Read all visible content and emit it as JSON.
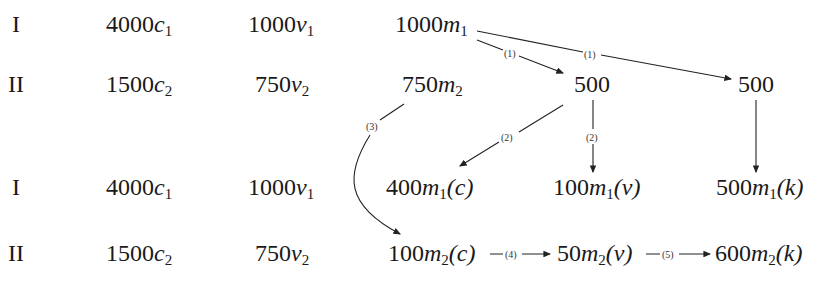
{
  "rows": [
    {
      "sector": "I",
      "c": "4000",
      "c_sym": "c",
      "c_sub": "1",
      "v": "1000",
      "v_sym": "v",
      "v_sub": "1",
      "m": "1000",
      "m_sym": "m",
      "m_sub": "1"
    },
    {
      "sector": "II",
      "c": "1500",
      "c_sym": "c",
      "c_sub": "2",
      "v": "750",
      "v_sym": "v",
      "v_sub": "2",
      "m": "750",
      "m_sym": "m",
      "m_sub": "2"
    },
    {
      "sector": "I",
      "c": "4000",
      "c_sym": "c",
      "c_sub": "1",
      "v": "1000",
      "v_sym": "v",
      "v_sub": "1"
    },
    {
      "sector": "II",
      "c": "1500",
      "c_sym": "c",
      "c_sub": "2",
      "v": "750",
      "v_sym": "v",
      "v_sub": "2"
    }
  ],
  "split": {
    "left": "500",
    "right": "500"
  },
  "m1_parts": {
    "c": {
      "value": "400",
      "sym": "m",
      "sub": "1",
      "tag": "(c)"
    },
    "v": {
      "value": "100",
      "sym": "m",
      "sub": "1",
      "tag": "(v)"
    },
    "k": {
      "value": "500",
      "sym": "m",
      "sub": "1",
      "tag": "(k)"
    }
  },
  "m2_parts": {
    "c": {
      "value": "100",
      "sym": "m",
      "sub": "2",
      "tag": "(c)"
    },
    "v": {
      "value": "50",
      "sym": "m",
      "sub": "2",
      "tag": "(v)"
    },
    "k": {
      "value": "600",
      "sym": "m",
      "sub": "2",
      "tag": "(k)"
    }
  },
  "steps": [
    "(1)",
    "(1)",
    "(2)",
    "(2)",
    "(3)",
    "(4)",
    "(5)"
  ]
}
